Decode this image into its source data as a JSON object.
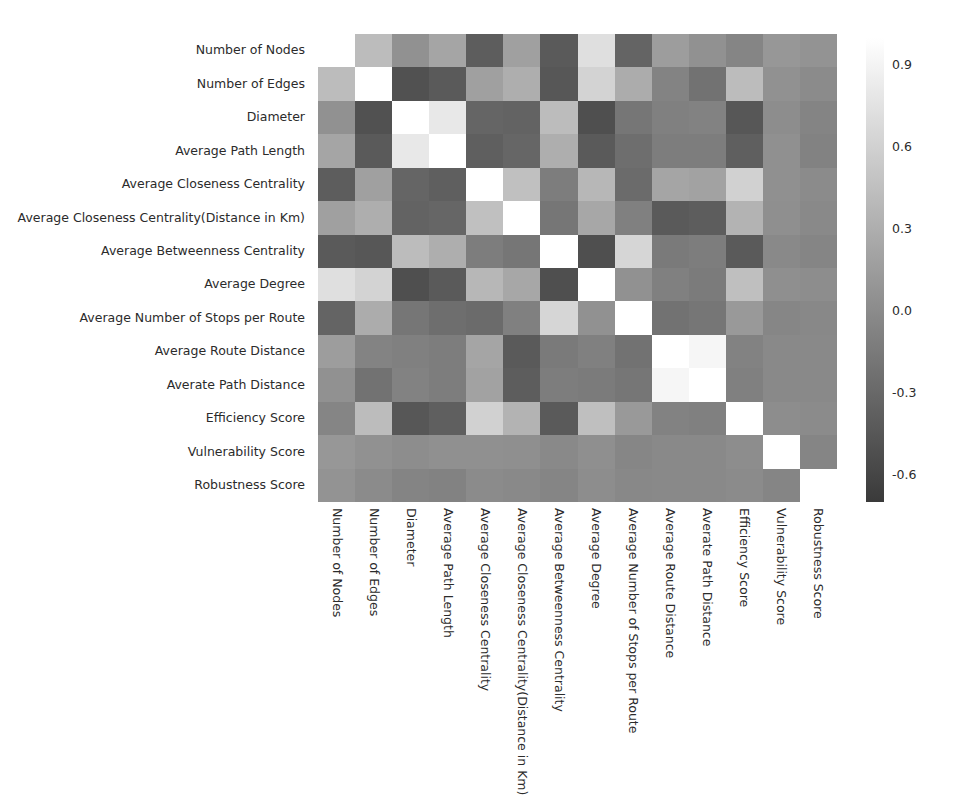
{
  "chart_data": {
    "type": "heatmap",
    "title": "",
    "xlabel": "",
    "ylabel": "",
    "grid": false,
    "legend_position": "right",
    "colormap": "gray",
    "colorbar": {
      "label": "",
      "ticks": [
        "0.9",
        "0.6",
        "0.3",
        "0.0",
        "-0.3",
        "-0.6"
      ],
      "tick_values": [
        0.9,
        0.6,
        0.3,
        0.0,
        -0.3,
        -0.6
      ],
      "vmin": -0.7,
      "vmax": 1.0,
      "low_color": "#3a3a3a",
      "high_color": "#ffffff"
    },
    "categories": [
      "Number of Nodes",
      "Number of Edges",
      "Diameter",
      "Average Path Length",
      "Average Closeness Centrality",
      "Average Closeness Centrality(Distance in Km)",
      "Average Betweenness Centrality",
      "Average Degree",
      "Average Number of Stops per Route",
      "Average Route Distance",
      "Averate Path Distance",
      "Efficiency Score",
      "Vulnerability Score",
      "Robustness Score"
    ],
    "x_categories": [
      "Number of Nodes",
      "Number of Edges",
      "Diameter",
      "Average Path Length",
      "Average Closeness Centrality",
      "Average Closeness Centrality(Distance in Km)",
      "Average Betweenness Centrality",
      "Average Degree",
      "Average Number of Stops per Route",
      "Average Route Distance",
      "Averate Path Distance",
      "Efficiency Score",
      "Vulnerability Score",
      "Robustness Score"
    ],
    "y_categories": [
      "Number of Nodes",
      "Number of Edges",
      "Diameter",
      "Average Path Length",
      "Average Closeness Centrality",
      "Average Closeness Centrality(Distance in Km)",
      "Average Betweenness Centrality",
      "Average Degree",
      "Average Number of Stops per Route",
      "Average Route Distance",
      "Averate Path Distance",
      "Efficiency Score",
      "Vulnerability Score",
      "Robustness Score"
    ],
    "values": [
      [
        1.0,
        0.42,
        0.05,
        0.22,
        -0.4,
        0.18,
        -0.42,
        0.72,
        -0.34,
        0.15,
        0.05,
        -0.05,
        0.1,
        0.07
      ],
      [
        0.42,
        1.0,
        -0.5,
        -0.42,
        0.18,
        0.3,
        -0.45,
        0.62,
        0.28,
        -0.07,
        -0.22,
        0.42,
        0.05,
        0.0
      ],
      [
        0.05,
        -0.5,
        1.0,
        0.8,
        -0.33,
        -0.35,
        0.42,
        -0.52,
        -0.18,
        -0.1,
        -0.08,
        -0.45,
        0.02,
        -0.06
      ],
      [
        0.22,
        -0.42,
        0.8,
        1.0,
        -0.38,
        -0.32,
        0.3,
        -0.42,
        -0.25,
        -0.12,
        -0.12,
        -0.38,
        0.04,
        -0.08
      ],
      [
        -0.4,
        0.18,
        -0.33,
        -0.38,
        1.0,
        0.46,
        -0.12,
        0.38,
        -0.28,
        0.22,
        0.2,
        0.6,
        0.04,
        0.0
      ],
      [
        0.18,
        0.3,
        -0.35,
        -0.32,
        0.46,
        1.0,
        -0.18,
        0.24,
        -0.1,
        -0.42,
        -0.4,
        0.34,
        0.03,
        -0.02
      ],
      [
        -0.42,
        -0.45,
        0.42,
        0.3,
        -0.12,
        -0.18,
        1.0,
        -0.52,
        0.65,
        -0.15,
        -0.12,
        -0.42,
        -0.02,
        -0.05
      ],
      [
        0.72,
        0.62,
        -0.52,
        -0.42,
        0.38,
        0.24,
        -0.52,
        1.0,
        0.05,
        -0.1,
        -0.14,
        0.45,
        0.03,
        0.02
      ],
      [
        -0.34,
        0.28,
        -0.18,
        -0.25,
        -0.28,
        -0.1,
        0.65,
        0.05,
        1.0,
        -0.22,
        -0.18,
        0.12,
        -0.04,
        -0.03
      ],
      [
        0.15,
        -0.07,
        -0.1,
        -0.12,
        0.22,
        -0.42,
        -0.15,
        -0.1,
        -0.22,
        1.0,
        0.92,
        -0.08,
        -0.02,
        -0.02
      ],
      [
        0.05,
        -0.22,
        -0.08,
        -0.12,
        0.2,
        -0.4,
        -0.12,
        -0.14,
        -0.18,
        0.92,
        1.0,
        -0.1,
        -0.02,
        -0.02
      ],
      [
        -0.05,
        0.42,
        -0.45,
        -0.38,
        0.6,
        0.34,
        -0.42,
        0.45,
        0.12,
        -0.08,
        -0.1,
        1.0,
        0.02,
        0.0
      ],
      [
        0.1,
        0.05,
        0.02,
        0.04,
        0.04,
        0.03,
        -0.02,
        0.03,
        -0.04,
        -0.02,
        -0.02,
        0.02,
        1.0,
        -0.05
      ],
      [
        0.07,
        0.0,
        -0.06,
        -0.08,
        0.0,
        -0.02,
        -0.05,
        0.02,
        -0.03,
        -0.02,
        -0.02,
        0.0,
        -0.05,
        1.0
      ]
    ]
  }
}
